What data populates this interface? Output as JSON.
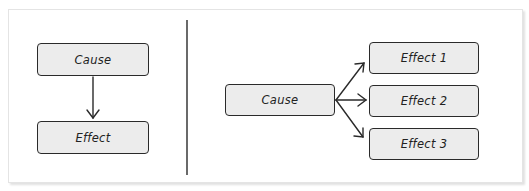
{
  "diagram": {
    "left": {
      "title": "Single cause to single effect",
      "nodes": [
        {
          "id": "cause",
          "label": "Cause"
        },
        {
          "id": "effect",
          "label": "Effect"
        }
      ],
      "edges": [
        {
          "from": "cause",
          "to": "effect"
        }
      ]
    },
    "right": {
      "title": "Single cause to multiple effects",
      "nodes": [
        {
          "id": "cause",
          "label": "Cause"
        },
        {
          "id": "effect1",
          "label": "Effect 1"
        },
        {
          "id": "effect2",
          "label": "Effect 2"
        },
        {
          "id": "effect3",
          "label": "Effect 3"
        }
      ],
      "edges": [
        {
          "from": "cause",
          "to": "effect1"
        },
        {
          "from": "cause",
          "to": "effect2"
        },
        {
          "from": "cause",
          "to": "effect3"
        }
      ]
    },
    "colors": {
      "box_fill": "#ececec",
      "stroke": "#2a2a2a",
      "background": "#ffffff"
    }
  }
}
